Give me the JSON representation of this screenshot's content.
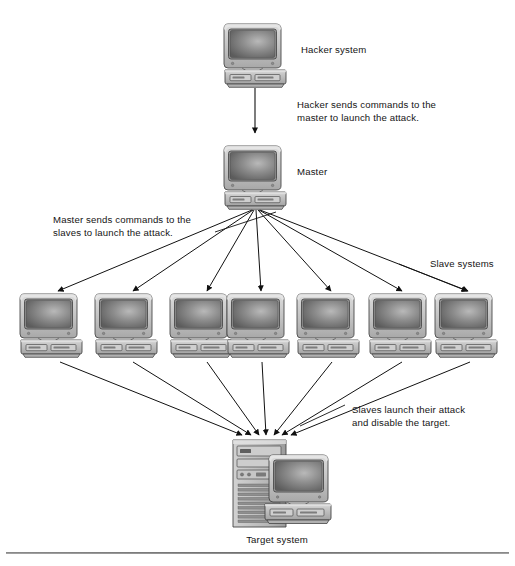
{
  "figure": {
    "type": "network-attack-diagram",
    "title_text": "",
    "background_color": "#ffffff",
    "line_color": "#1a1a1a",
    "device_fill": "#bdbdbd",
    "screen_color": "#6e6e6e"
  },
  "labels": {
    "hacker_system": "Hacker system",
    "hacker_commands": "Hacker sends commands to the\nmaster to launch the attack.",
    "master": "Master",
    "master_commands": "Master sends commands to the\nslaves to launch the attack.",
    "slave_systems": "Slave systems",
    "slaves_attack": "Slaves launch their attack\nand disable the target.",
    "target_system": "Target system"
  },
  "nodes": {
    "hacker": {
      "label": "Hacker system",
      "x": 255,
      "y": 55,
      "kind": "desktop-monitor"
    },
    "master": {
      "label": "Master",
      "x": 255,
      "y": 177,
      "kind": "desktop-monitor"
    },
    "target": {
      "label": "Target system",
      "x": 275,
      "y": 487,
      "kind": "tower-and-monitor"
    },
    "slaves": [
      {
        "label": "Slave system 1",
        "x": 51,
        "y": 325,
        "kind": "desktop-monitor"
      },
      {
        "label": "Slave system 2",
        "x": 126,
        "y": 325,
        "kind": "desktop-monitor"
      },
      {
        "label": "Slave system 3",
        "x": 201,
        "y": 325,
        "kind": "desktop-monitor"
      },
      {
        "label": "Slave system 4",
        "x": 258,
        "y": 325,
        "kind": "desktop-monitor"
      },
      {
        "label": "Slave system 5",
        "x": 328,
        "y": 325,
        "kind": "desktop-monitor"
      },
      {
        "label": "Slave system 6",
        "x": 400,
        "y": 325,
        "kind": "desktop-monitor"
      },
      {
        "label": "Slave system 7",
        "x": 466,
        "y": 325,
        "kind": "desktop-monitor"
      }
    ]
  },
  "edges": {
    "hacker_to_master_count": 1,
    "master_to_slaves_count": 7,
    "slaves_to_target_count": 7
  }
}
